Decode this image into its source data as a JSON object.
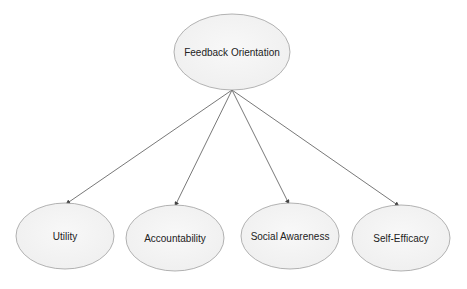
{
  "diagram": {
    "type": "factor-model",
    "colors": {
      "node_fill": "#f4f4f4",
      "node_stroke": "#9a9a9a",
      "edge": "#555555",
      "text": "#222222"
    },
    "root": {
      "label": "Feedback Orientation",
      "cx": 232,
      "cy": 52,
      "rx": 58,
      "ry": 38
    },
    "children": [
      {
        "label": "Utility",
        "cx": 65,
        "cy": 236,
        "rx": 49,
        "ry": 33,
        "arrow_tip": [
          66,
          204
        ]
      },
      {
        "label": "Accountability",
        "cx": 175,
        "cy": 238,
        "rx": 49,
        "ry": 33,
        "arrow_tip": [
          175,
          206
        ]
      },
      {
        "label": "Social Awareness",
        "cx": 290,
        "cy": 236,
        "rx": 49,
        "ry": 33,
        "arrow_tip": [
          289,
          204
        ]
      },
      {
        "label": "Self-Efficacy",
        "cx": 401,
        "cy": 238,
        "rx": 49,
        "ry": 33,
        "arrow_tip": [
          399,
          206
        ]
      }
    ],
    "edge_origin": [
      232,
      90
    ]
  }
}
